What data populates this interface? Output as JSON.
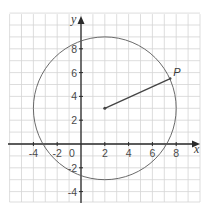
{
  "diagram": {
    "type": "coordinate-geometry",
    "axes": {
      "x_label": "x",
      "y_label": "y",
      "x_range": [
        -6,
        10
      ],
      "y_range": [
        -5,
        11
      ],
      "x_ticks": [
        {
          "value": -4,
          "label": "-4"
        },
        {
          "value": -2,
          "label": "-2"
        },
        {
          "value": 2,
          "label": "2"
        },
        {
          "value": 4,
          "label": "4"
        },
        {
          "value": 6,
          "label": "6"
        },
        {
          "value": 8,
          "label": "8"
        }
      ],
      "y_ticks": [
        {
          "value": 8,
          "label": "8"
        },
        {
          "value": 6,
          "label": "6"
        },
        {
          "value": 4,
          "label": "4"
        },
        {
          "value": 2,
          "label": "2"
        },
        {
          "value": -2,
          "label": "-2"
        },
        {
          "value": -4,
          "label": "-4"
        }
      ],
      "origin_label": "0"
    },
    "circle": {
      "center": [
        2,
        3
      ],
      "radius": 6
    },
    "point": {
      "label": "P",
      "coords": [
        7.5,
        5.5
      ]
    },
    "colors": {
      "grid": "#d4d4d4",
      "axis": "#2a2a2a",
      "circle": "#5a5a5a",
      "radius": "#444444"
    }
  }
}
